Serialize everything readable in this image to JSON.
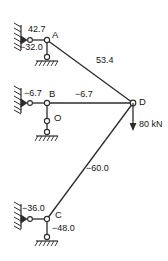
{
  "diagram": {
    "units": "kN",
    "stroke_color": "#2b2b2b",
    "text_color": "#141414",
    "background": "#ffffff"
  },
  "nodes": [
    {
      "id": "A",
      "label": "A",
      "x": 47,
      "y": 40
    },
    {
      "id": "B",
      "label": "B",
      "x": 47,
      "y": 103
    },
    {
      "id": "C",
      "label": "C",
      "x": 47,
      "y": 219
    },
    {
      "id": "D",
      "label": "D",
      "x": 133,
      "y": 103
    },
    {
      "id": "O",
      "label": "O",
      "x": 47,
      "y": 122
    }
  ],
  "members": [
    {
      "id": "wall-A",
      "label": "42.7",
      "from": "wall-top",
      "to": "A"
    },
    {
      "id": "A-pin",
      "label": "-32.0",
      "from": "A",
      "to": "pin-top"
    },
    {
      "id": "A-D",
      "label": "53.4",
      "from": "A",
      "to": "D"
    },
    {
      "id": "wall-B",
      "label": "-6.7",
      "from": "wall-mid",
      "to": "B"
    },
    {
      "id": "B-D",
      "label": "-6.7",
      "from": "B",
      "to": "D"
    },
    {
      "id": "C-D",
      "label": "-60.0",
      "from": "C",
      "to": "D"
    },
    {
      "id": "wall-C",
      "label": "-36.0",
      "from": "wall-bot",
      "to": "C"
    },
    {
      "id": "C-pin",
      "label": "-48.0",
      "from": "C",
      "to": "pin-bot"
    }
  ],
  "load": {
    "id": "load-D",
    "label": "80 kN",
    "magnitude": "80",
    "unit": "kN",
    "direction": "down",
    "at_node": "D"
  },
  "labels": {
    "force_42_7": "42.7",
    "force_neg_32_0": "−32.0",
    "force_53_4": "53.4",
    "force_neg_6_7_left": "−6.7",
    "force_neg_6_7_right": "−6.7",
    "force_neg_60_0": "−60.0",
    "force_neg_36_0": "−36.0",
    "force_neg_48_0": "−48.0",
    "node_a": "A",
    "node_b": "B",
    "node_c": "C",
    "node_d": "D",
    "node_o": "O",
    "load_text": "80 kN"
  }
}
